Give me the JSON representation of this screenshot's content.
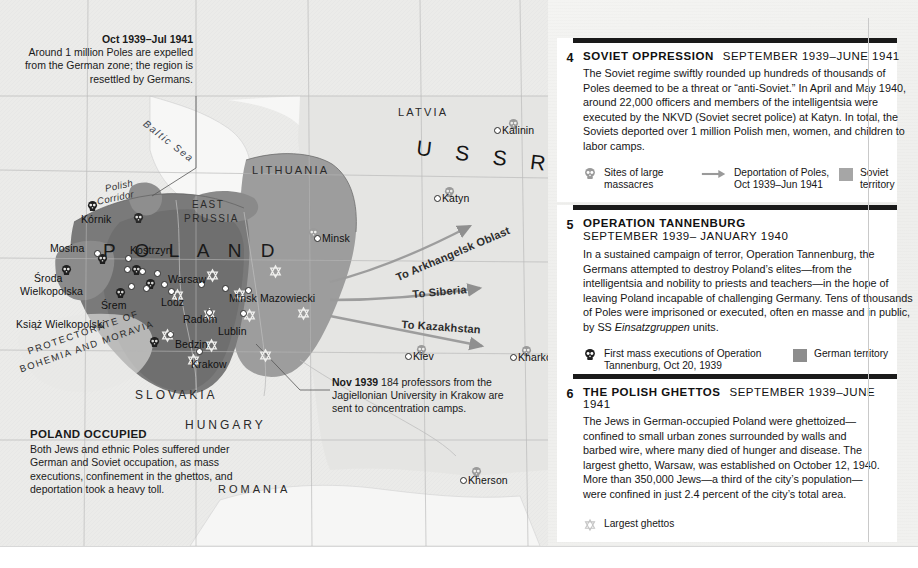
{
  "map": {
    "seas": [
      {
        "name": "Baltic Sea",
        "label": "Baltic Sea"
      }
    ],
    "countries": [
      {
        "name": "latvia",
        "label": "LATVIA"
      },
      {
        "name": "lithuania",
        "label": "LITHUANIA"
      },
      {
        "name": "east-prussia-1",
        "label": "EAST"
      },
      {
        "name": "east-prussia-2",
        "label": "PRUSSIA"
      },
      {
        "name": "ussr",
        "label": "U S S R"
      },
      {
        "name": "poland",
        "label": "P O L A N D"
      },
      {
        "name": "slovakia",
        "label": "SLOVAKIA"
      },
      {
        "name": "hungary",
        "label": "HUNGARY"
      },
      {
        "name": "romania",
        "label": "ROMANIA"
      },
      {
        "name": "protectorate-1",
        "label": "PROTECTORATE OF"
      },
      {
        "name": "protectorate-2",
        "label": "BOHEMIA AND MORAVIA"
      },
      {
        "name": "polish-corridor-1",
        "label": "Polish"
      },
      {
        "name": "polish-corridor-2",
        "label": "Corridor"
      }
    ],
    "cities": [
      {
        "name": "kornik",
        "label": "Kórnik"
      },
      {
        "name": "mosina",
        "label": "Mosina"
      },
      {
        "name": "kostrzyn",
        "label": "Kostrzyn"
      },
      {
        "name": "sroda-wielkopolska-1",
        "label": "Środa"
      },
      {
        "name": "sroda-wielkopolska-2",
        "label": "Wielkopolska"
      },
      {
        "name": "srem",
        "label": "Śrem"
      },
      {
        "name": "ksiaz-wielkopolski",
        "label": "Książ Wielkopolski"
      },
      {
        "name": "warsaw",
        "label": "Warsaw"
      },
      {
        "name": "lodz",
        "label": "Lodz"
      },
      {
        "name": "radom",
        "label": "Radom"
      },
      {
        "name": "lublin",
        "label": "Lublin"
      },
      {
        "name": "minsk-mazowiecki",
        "label": "Minsk Mazowiecki"
      },
      {
        "name": "bedzin",
        "label": "Bedzin"
      },
      {
        "name": "krakow",
        "label": "Krakow"
      },
      {
        "name": "minsk",
        "label": "Minsk"
      },
      {
        "name": "katyn",
        "label": "Katyn"
      },
      {
        "name": "kalinin",
        "label": "Kalinin"
      },
      {
        "name": "kiev",
        "label": "Kiev"
      },
      {
        "name": "kharkov",
        "label": "Kharkov"
      },
      {
        "name": "kherson",
        "label": "Kherson"
      }
    ],
    "deportation_arrows": [
      {
        "name": "to-arkhangelsk-oblast",
        "label": "To Arkhangelsk Oblast"
      },
      {
        "name": "to-siberia",
        "label": "To Siberia"
      },
      {
        "name": "to-kazakhstan",
        "label": "To Kazakhstan"
      }
    ],
    "callouts": {
      "expulsion": {
        "date": "Oct 1939–Jul 1941",
        "text": "Around 1 million Poles are expelled from the German zone; the region is resettled by Germans."
      },
      "professors": {
        "date": "Nov 1939",
        "text": "184 professors from the Jagiellonian University in Krakow are sent to concentration camps."
      },
      "poland_occupied": {
        "title": "POLAND OCCUPIED",
        "text": "Both Jews and ethnic Poles suffered under German and Soviet occupation, as mass executions, confinement in the ghettos, and deportation took a heavy toll."
      }
    }
  },
  "panels": [
    {
      "number": "4",
      "title": "SOVIET OPPRESSION",
      "date": "SEPTEMBER 1939–JUNE 1941",
      "date_inline": true,
      "text": "The Soviet regime swiftly rounded up hundreds of thousands of Poles deemed to be a threat or “anti-Soviet.” In April and May 1940, around 22,000 officers and members of the intelligentsia were executed by the NKVD (Soviet secret police) at Katyn. In total, the Soviets deported over 1 million Polish men, women, and children to labor camps.",
      "legend": [
        {
          "icon": "skull-icon",
          "label": "Sites of large massacres"
        },
        {
          "icon": "arrow-icon",
          "label": "Deportation of Poles, Oct 1939–Jun 1941"
        },
        {
          "icon": "swatch-soviet",
          "label": "Soviet territory"
        }
      ]
    },
    {
      "number": "5",
      "title": "OPERATION TANNENBURG",
      "date": "SEPTEMBER 1939– JANUARY 1940",
      "date_inline": false,
      "text": "In a sustained campaign of terror, Operation Tannenburg, the Germans attempted to destroy Poland’s elites—from the intelligentsia and nobility to priests and teachers—in the hope of leaving Poland incapable of challenging Germany. Tens of thousands of Poles were imprisoned or executed, often en masse and in public, by SS <i>Einsatzgruppen</i> units.",
      "legend": [
        {
          "icon": "skull-icon",
          "label": "First mass executions of Operation Tannenburg, Oct 20, 1939"
        },
        {
          "icon": "swatch-german",
          "label": "German territory"
        }
      ]
    },
    {
      "number": "6",
      "title": "THE POLISH GHETTOS",
      "date": "SEPTEMBER 1939–JUNE 1941",
      "date_inline": true,
      "text": "The Jews in German-occupied Poland were ghettoized—confined to small urban zones surrounded by walls and barbed wire, where many died of hunger and disease. The largest ghetto, Warsaw, was established on October 12, 1940. More than 350,000 Jews—a third of the city’s population—were confined in just 2.4 percent of the city’s total area.",
      "legend": [
        {
          "icon": "star-icon",
          "label": "Largest ghettos"
        }
      ]
    }
  ],
  "colors": {
    "german_territory": "#8d8d8d",
    "soviet_territory": "#a6a6a6",
    "poland_core": "#6f6f6f",
    "map_background": "#ededeb",
    "panel_bar": "#1a1a1a"
  }
}
